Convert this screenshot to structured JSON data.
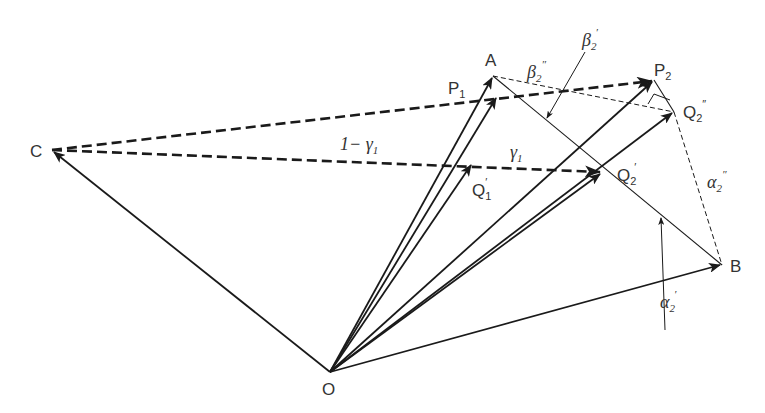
{
  "diagram": {
    "type": "vector-geometry",
    "colors": {
      "stroke": "#1a1a1a",
      "text": "#333333",
      "background": "#ffffff"
    },
    "points": {
      "O": {
        "label": "O",
        "x": 330,
        "y": 372
      },
      "C": {
        "label": "C",
        "x": 52,
        "y": 150
      },
      "A": {
        "label": "A",
        "x": 493,
        "y": 76
      },
      "P1": {
        "label": "P",
        "sub": "1",
        "x": 497,
        "y": 96
      },
      "Q1p": {
        "label": "Q",
        "sub": "1",
        "prime": "′",
        "x": 472,
        "y": 163
      },
      "P2": {
        "label": "P",
        "sub": "2",
        "x": 654,
        "y": 80
      },
      "Q2pp": {
        "label": "Q",
        "sub": "2",
        "prime": "″",
        "x": 674,
        "y": 112
      },
      "Q2p": {
        "label": "Q",
        "sub": "2",
        "prime": "′",
        "x": 602,
        "y": 172
      },
      "B": {
        "label": "B",
        "x": 722,
        "y": 265
      }
    },
    "labels": {
      "A": "A",
      "B": "B",
      "C": "C",
      "O": "O",
      "P1_main": "P",
      "P1_sub": "1",
      "P2_main": "P",
      "P2_sub": "2",
      "Q1p_main": "Q",
      "Q1p_sub": "1",
      "Q1p_prime": "′",
      "Q2p_main": "Q",
      "Q2p_sub": "2",
      "Q2p_prime": "′",
      "Q2pp_main": "Q",
      "Q2pp_sub": "2",
      "Q2pp_prime": "″",
      "one_minus_gamma1": "1− γ",
      "one_minus_gamma1_sub": "1",
      "gamma1": "γ",
      "gamma1_sub": "1",
      "beta2p": "β",
      "beta2p_sub": "2",
      "beta2p_prime": "′",
      "beta2pp": "β",
      "beta2pp_sub": "2",
      "beta2pp_prime": "″",
      "alpha2p": "α",
      "alpha2p_sub": "2",
      "alpha2p_prime": "′",
      "alpha2pp": "α",
      "alpha2pp_sub": "2",
      "alpha2pp_prime": "″"
    },
    "vectors_solid": [
      "O→C",
      "O→A",
      "O→P1",
      "O→Q1′",
      "O→P2",
      "O→Q2″",
      "O→Q2′",
      "O→B"
    ],
    "vectors_dashed_bold": [
      "C→P2",
      "C→Q2′"
    ],
    "lines_thin": [
      "A→B"
    ],
    "lines_thin_dashed": [
      "A→Q2″",
      "P2→Q2″",
      "Q2″→B"
    ],
    "annotation_arrows": [
      "β2′ pointer",
      "α2′ pointer"
    ]
  }
}
